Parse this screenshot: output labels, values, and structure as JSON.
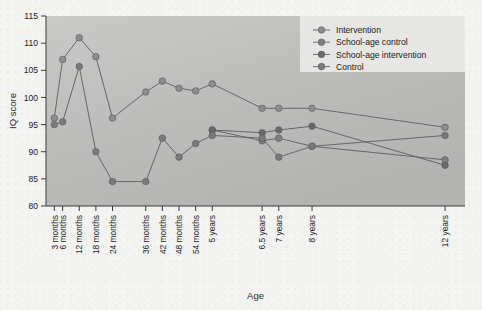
{
  "chart_data": {
    "type": "line",
    "title": "",
    "xlabel": "Age",
    "ylabel": "IQ score",
    "ylim": [
      80,
      115
    ],
    "yticks": [
      80,
      85,
      90,
      95,
      100,
      105,
      110,
      115
    ],
    "grid": false,
    "legend_position": "top-right",
    "categories": [
      "3 months",
      "6 months",
      "12 months",
      "18 months",
      "24 months",
      "36 months",
      "42 months",
      "48 months",
      "54 months",
      "5 years",
      "6.5 years",
      "7 years",
      "8 years",
      "12 years"
    ],
    "x": [
      0.25,
      0.5,
      1,
      1.5,
      2,
      3,
      3.5,
      4,
      4.5,
      5,
      6.5,
      7,
      8,
      12
    ],
    "series": [
      {
        "name": "Intervention",
        "color": "#8d8d8d",
        "x": [
          0.25,
          0.5,
          1,
          1.5,
          2,
          3,
          3.5,
          4,
          4.5,
          5,
          6.5,
          7,
          8,
          12
        ],
        "values": [
          96.2,
          107,
          111,
          107.5,
          96.2,
          101,
          103,
          101.7,
          101.2,
          102.5,
          98,
          98,
          98,
          94.5
        ]
      },
      {
        "name": "School-age control",
        "color": "#7e7e7e",
        "x": [
          5,
          6.5,
          7,
          8,
          12
        ],
        "values": [
          94,
          92,
          92.5,
          91,
          88.5
        ]
      },
      {
        "name": "School-age intervention",
        "color": "#6a6a6a",
        "x": [
          5,
          6.5,
          7,
          8,
          12
        ],
        "values": [
          94,
          93.5,
          94,
          94.7,
          87.5
        ]
      },
      {
        "name": "Control",
        "color": "#7a7a7a",
        "x": [
          0.25,
          0.5,
          1,
          1.5,
          2,
          3,
          3.5,
          4,
          4.5,
          5,
          6.5,
          7,
          8,
          12
        ],
        "values": [
          95,
          95.5,
          105.7,
          90,
          84.5,
          84.5,
          92.5,
          89,
          91.5,
          93,
          92.5,
          89,
          91,
          93
        ]
      }
    ]
  },
  "legend": {
    "items": [
      {
        "label": "Intervention"
      },
      {
        "label": "School-age control"
      },
      {
        "label": "School-age intervention"
      },
      {
        "label": "Control"
      }
    ]
  }
}
